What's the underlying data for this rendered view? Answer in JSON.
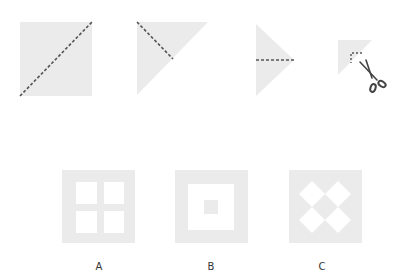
{
  "colors": {
    "paper": "#ebebeb",
    "hole": "#ffffff",
    "fold_line": "#555555",
    "scissors": "#444444",
    "background": "#ffffff"
  },
  "folding_steps": [
    {
      "step": 1,
      "shape": "square",
      "fold": "diagonal dashed line from bottom-left to top-right"
    },
    {
      "step": 2,
      "shape": "right triangle",
      "fold": "dashed line from right-angle vertex to hypotenuse midpoint"
    },
    {
      "step": 3,
      "shape": "triangle",
      "fold": "horizontal dashed line from left edge midpoint to apex"
    },
    {
      "step": 4,
      "shape": "small right triangle",
      "fold": "L-shaped dashed cut near corner",
      "icon": "scissors-icon"
    }
  ],
  "options": [
    {
      "label": "A",
      "description": "square with four square holes in 2x2 grid"
    },
    {
      "label": "B",
      "description": "square frame with large square hole and small square in center"
    },
    {
      "label": "C",
      "description": "square with four diamond-shaped holes"
    }
  ]
}
